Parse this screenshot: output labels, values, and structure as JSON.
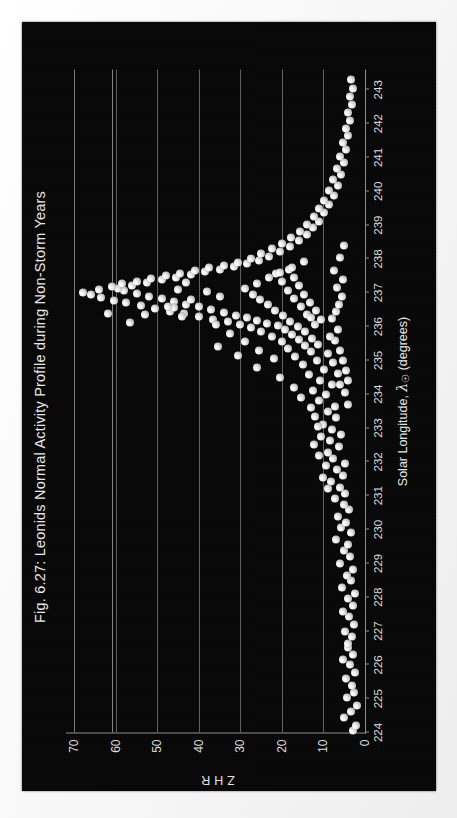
{
  "figure": {
    "title": "Fig. 6.27: Leonids Normal Activity Profile during Non-Storm Years",
    "background_color": "#070707",
    "page_color": "#fbfbfb",
    "marker_color": "#e8e8e8",
    "axis_color": "#8d8d8d",
    "orientation": "rotated-90-ccw"
  },
  "axis": {
    "ylabel": "ZHR",
    "xlabel_prefix": "Solar Longitude, ",
    "xlabel_symbol": "λ",
    "xlabel_subscript": "☉",
    "xlabel_suffix": " (degrees)"
  },
  "chart_data": {
    "type": "scatter",
    "title": "Fig. 6.27: Leonids Normal Activity Profile during Non-Storm Years",
    "xlabel": "Solar Longitude, λ☉ (degrees)",
    "ylabel": "ZHR",
    "xlim": [
      224,
      243.6
    ],
    "ylim": [
      0,
      72
    ],
    "xticks": [
      224,
      225,
      226,
      227,
      228,
      229,
      230,
      231,
      232,
      233,
      234,
      235,
      236,
      237,
      238,
      239,
      240,
      241,
      242,
      243
    ],
    "yticks": [
      0,
      10,
      20,
      30,
      40,
      50,
      60,
      70
    ],
    "grid": "horizontal",
    "legend": null,
    "series": [
      {
        "name": "ZHR observations",
        "marker": "sphere",
        "color": "#e8e8e8",
        "points": [
          [
            224.05,
            3.0
          ],
          [
            224.2,
            2.2
          ],
          [
            224.45,
            5.0
          ],
          [
            224.62,
            3.4
          ],
          [
            224.8,
            2.0
          ],
          [
            225.02,
            4.3
          ],
          [
            225.18,
            2.6
          ],
          [
            225.4,
            3.1
          ],
          [
            225.6,
            4.6
          ],
          [
            225.78,
            2.4
          ],
          [
            226.0,
            3.6
          ],
          [
            226.15,
            5.2
          ],
          [
            226.32,
            2.9
          ],
          [
            226.5,
            4.0
          ],
          [
            226.62,
            4.0
          ],
          [
            226.85,
            3.2
          ],
          [
            227.0,
            4.8
          ],
          [
            227.2,
            2.7
          ],
          [
            227.42,
            3.9
          ],
          [
            227.58,
            5.4
          ],
          [
            227.75,
            3.0
          ],
          [
            227.95,
            4.2
          ],
          [
            228.1,
            2.5
          ],
          [
            228.3,
            5.6
          ],
          [
            228.48,
            3.3
          ],
          [
            228.65,
            4.4
          ],
          [
            228.82,
            2.8
          ],
          [
            229.0,
            6.1
          ],
          [
            229.2,
            3.7
          ],
          [
            229.38,
            5.0
          ],
          [
            229.55,
            4.1
          ],
          [
            229.72,
            7.0
          ],
          [
            229.9,
            3.4
          ],
          [
            230.05,
            5.8
          ],
          [
            230.22,
            4.5
          ],
          [
            230.4,
            6.5
          ],
          [
            230.58,
            3.9
          ],
          [
            230.75,
            5.1
          ],
          [
            230.92,
            7.3
          ],
          [
            231.08,
            4.7
          ],
          [
            231.25,
            6.0
          ],
          [
            231.42,
            8.1
          ],
          [
            231.6,
            5.3
          ],
          [
            231.78,
            6.8
          ],
          [
            231.95,
            4.9
          ],
          [
            232.1,
            7.6
          ],
          [
            232.28,
            9.0
          ],
          [
            232.45,
            6.2
          ],
          [
            232.62,
            8.4
          ],
          [
            232.8,
            5.7
          ],
          [
            232.95,
            7.9
          ],
          [
            233.12,
            10.2
          ],
          [
            233.3,
            6.9
          ],
          [
            233.48,
            8.8
          ],
          [
            233.65,
            7.2
          ],
          [
            233.82,
            11.0
          ],
          [
            233.98,
            9.4
          ],
          [
            234.12,
            12.6
          ],
          [
            234.28,
            8.0
          ],
          [
            234.42,
            10.8
          ],
          [
            234.58,
            13.5
          ],
          [
            234.72,
            9.8
          ],
          [
            234.88,
            15.0
          ],
          [
            235.0,
            11.5
          ],
          [
            235.12,
            16.8
          ],
          [
            235.25,
            13.0
          ],
          [
            235.35,
            18.5
          ],
          [
            235.45,
            14.4
          ],
          [
            235.55,
            20.1
          ],
          [
            235.62,
            16.0
          ],
          [
            235.7,
            22.4
          ],
          [
            235.78,
            17.5
          ],
          [
            235.85,
            25.0
          ],
          [
            235.9,
            19.2
          ],
          [
            235.96,
            27.5
          ],
          [
            236.02,
            21.0
          ],
          [
            236.06,
            30.0
          ],
          [
            236.1,
            23.5
          ],
          [
            236.14,
            33.0
          ],
          [
            236.18,
            26.0
          ],
          [
            236.22,
            36.5
          ],
          [
            236.26,
            28.5
          ],
          [
            236.3,
            40.0
          ],
          [
            236.34,
            31.0
          ],
          [
            236.38,
            43.5
          ],
          [
            236.42,
            34.0
          ],
          [
            236.46,
            47.0
          ],
          [
            236.5,
            37.0
          ],
          [
            236.54,
            50.5
          ],
          [
            236.58,
            40.0
          ],
          [
            236.62,
            54.0
          ],
          [
            236.66,
            43.0
          ],
          [
            236.7,
            57.5
          ],
          [
            236.74,
            46.0
          ],
          [
            236.78,
            60.5
          ],
          [
            236.82,
            49.0
          ],
          [
            236.86,
            63.5
          ],
          [
            236.9,
            52.0
          ],
          [
            236.94,
            66.0
          ],
          [
            236.98,
            55.0
          ],
          [
            237.02,
            68.0
          ],
          [
            237.06,
            58.0
          ],
          [
            237.1,
            64.0
          ],
          [
            237.14,
            59.5
          ],
          [
            237.18,
            61.0
          ],
          [
            237.22,
            56.0
          ],
          [
            237.26,
            58.5
          ],
          [
            237.3,
            52.5
          ],
          [
            237.34,
            55.0
          ],
          [
            237.38,
            49.0
          ],
          [
            237.42,
            51.5
          ],
          [
            237.46,
            45.5
          ],
          [
            237.5,
            48.0
          ],
          [
            237.54,
            42.0
          ],
          [
            237.58,
            44.5
          ],
          [
            237.62,
            38.5
          ],
          [
            237.66,
            41.0
          ],
          [
            237.7,
            35.0
          ],
          [
            237.74,
            37.5
          ],
          [
            237.78,
            31.5
          ],
          [
            237.82,
            34.0
          ],
          [
            237.86,
            28.5
          ],
          [
            237.9,
            30.5
          ],
          [
            237.95,
            25.5
          ],
          [
            238.0,
            27.5
          ],
          [
            238.08,
            23.0
          ],
          [
            238.15,
            25.0
          ],
          [
            238.22,
            20.5
          ],
          [
            238.3,
            22.5
          ],
          [
            238.38,
            18.0
          ],
          [
            238.46,
            20.0
          ],
          [
            238.55,
            16.0
          ],
          [
            238.64,
            17.8
          ],
          [
            238.72,
            14.0
          ],
          [
            238.82,
            15.6
          ],
          [
            238.92,
            12.5
          ],
          [
            239.02,
            14.0
          ],
          [
            239.12,
            11.0
          ],
          [
            239.24,
            12.4
          ],
          [
            239.36,
            9.8
          ],
          [
            239.48,
            11.0
          ],
          [
            239.6,
            8.6
          ],
          [
            239.74,
            9.8
          ],
          [
            239.88,
            7.5
          ],
          [
            240.02,
            8.6
          ],
          [
            240.18,
            6.6
          ],
          [
            240.34,
            7.6
          ],
          [
            240.5,
            5.8
          ],
          [
            240.68,
            6.7
          ],
          [
            240.86,
            5.1
          ],
          [
            241.04,
            5.9
          ],
          [
            241.24,
            4.5
          ],
          [
            241.44,
            5.2
          ],
          [
            241.64,
            4.0
          ],
          [
            241.86,
            4.6
          ],
          [
            242.08,
            3.6
          ],
          [
            242.32,
            4.1
          ],
          [
            242.56,
            3.2
          ],
          [
            242.8,
            3.7
          ],
          [
            243.04,
            2.9
          ],
          [
            243.3,
            3.4
          ],
          [
            235.2,
            9.0
          ],
          [
            234.95,
            7.8
          ],
          [
            234.6,
            6.5
          ],
          [
            234.3,
            5.9
          ],
          [
            236.05,
            12.0
          ],
          [
            236.2,
            10.5
          ],
          [
            236.35,
            14.0
          ],
          [
            236.48,
            11.8
          ],
          [
            236.6,
            15.5
          ],
          [
            236.72,
            13.2
          ],
          [
            236.84,
            17.0
          ],
          [
            236.96,
            14.6
          ],
          [
            237.08,
            18.5
          ],
          [
            237.2,
            16.0
          ],
          [
            237.32,
            20.0
          ],
          [
            237.44,
            17.2
          ],
          [
            237.56,
            21.5
          ],
          [
            237.68,
            18.4
          ],
          [
            235.48,
            11.2
          ],
          [
            235.66,
            12.8
          ],
          [
            235.84,
            14.5
          ],
          [
            236.0,
            16.2
          ],
          [
            236.16,
            18.0
          ],
          [
            236.32,
            19.8
          ],
          [
            236.48,
            21.6
          ],
          [
            236.64,
            23.4
          ],
          [
            236.8,
            25.2
          ],
          [
            236.96,
            27.0
          ],
          [
            237.12,
            28.8
          ],
          [
            237.28,
            26.0
          ],
          [
            237.44,
            23.2
          ],
          [
            237.6,
            20.4
          ],
          [
            237.76,
            17.6
          ],
          [
            237.92,
            14.8
          ],
          [
            235.05,
            22.0
          ],
          [
            235.3,
            25.5
          ],
          [
            235.55,
            29.0
          ],
          [
            235.8,
            32.5
          ],
          [
            236.05,
            36.0
          ],
          [
            236.3,
            44.0
          ],
          [
            236.55,
            46.0
          ],
          [
            236.8,
            42.0
          ],
          [
            237.05,
            38.0
          ],
          [
            237.3,
            43.0
          ],
          [
            236.12,
            56.5
          ],
          [
            236.36,
            53.0
          ],
          [
            236.58,
            47.5
          ],
          [
            235.4,
            35.5
          ],
          [
            235.15,
            30.5
          ],
          [
            234.8,
            26.0
          ],
          [
            234.5,
            20.5
          ],
          [
            234.2,
            17.0
          ],
          [
            233.9,
            15.5
          ],
          [
            233.6,
            13.0
          ],
          [
            233.35,
            12.0
          ],
          [
            233.05,
            11.2
          ],
          [
            232.75,
            10.5
          ],
          [
            232.5,
            12.2
          ],
          [
            232.2,
            11.0
          ],
          [
            231.9,
            9.5
          ],
          [
            231.55,
            10.2
          ],
          [
            231.2,
            8.8
          ],
          [
            236.25,
            8.0
          ],
          [
            236.45,
            7.0
          ],
          [
            236.65,
            6.2
          ],
          [
            236.88,
            5.5
          ],
          [
            237.15,
            6.8
          ],
          [
            237.4,
            5.2
          ],
          [
            237.66,
            7.4
          ],
          [
            238.05,
            6.0
          ],
          [
            238.4,
            5.0
          ],
          [
            235.9,
            6.5
          ],
          [
            235.6,
            7.2
          ],
          [
            235.3,
            6.0
          ],
          [
            235.0,
            5.4
          ],
          [
            234.7,
            4.6
          ],
          [
            234.4,
            4.0
          ],
          [
            234.05,
            4.8
          ],
          [
            233.7,
            4.2
          ],
          [
            236.4,
            62.0
          ],
          [
            236.28,
            13.0
          ],
          [
            235.72,
            8.5
          ],
          [
            236.9,
            35.0
          ],
          [
            237.1,
            45.0
          ]
        ]
      }
    ],
    "annotations": [
      {
        "type": "hline",
        "y": 61.0,
        "color": "#9a9a9a",
        "note": "horizontal reference line across plot"
      }
    ]
  }
}
